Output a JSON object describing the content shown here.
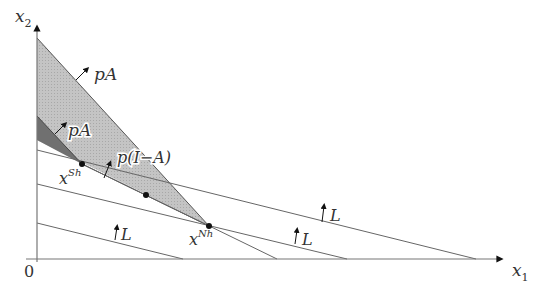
{
  "diagram": {
    "axes": {
      "x_label": "x",
      "x_sub": "1",
      "y_label": "x",
      "y_sub": "2",
      "origin_label": "0"
    },
    "regions": [
      {
        "name": "pA-large",
        "label": "pA",
        "fill": "#bdbdbd"
      },
      {
        "name": "pA-small",
        "label": "pA",
        "fill": "#6e6e6e"
      },
      {
        "name": "p(I-A)",
        "label": "p(I−A)"
      }
    ],
    "points": [
      {
        "name": "x-Sh",
        "base": "x",
        "sup": "Sh"
      },
      {
        "name": "mid-point",
        "base": "",
        "sup": ""
      },
      {
        "name": "x-Nh",
        "base": "x",
        "sup": "Nh"
      }
    ],
    "labor_lines": [
      {
        "label": "L"
      },
      {
        "label": "L"
      },
      {
        "label": "L"
      }
    ]
  }
}
